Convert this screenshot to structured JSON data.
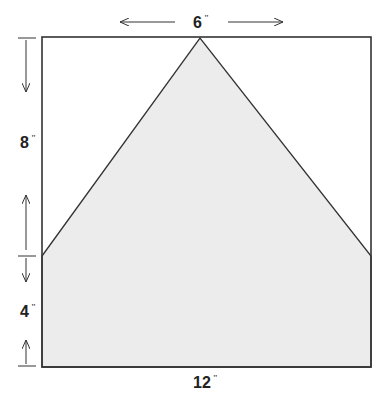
{
  "diagram": {
    "type": "pattern-piece",
    "shape": "pentagon (house shape) inside square",
    "dimensions": {
      "top": {
        "value": "6",
        "unit": "\""
      },
      "upper_side": {
        "value": "8",
        "unit": "\""
      },
      "lower_side": {
        "value": "4",
        "unit": "\""
      },
      "bottom": {
        "value": "12",
        "unit": "\""
      }
    },
    "colors": {
      "fill": "#ececec",
      "stroke": "#333333",
      "text": "#222222"
    }
  }
}
